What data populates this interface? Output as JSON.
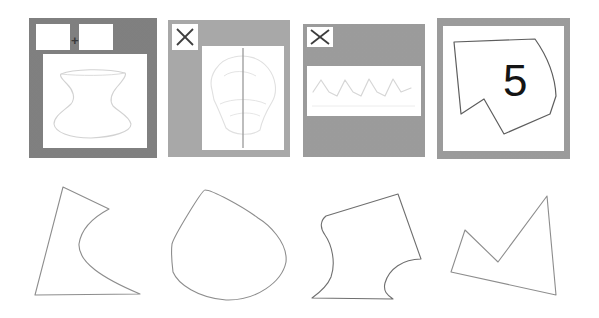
{
  "figure": {
    "background_color": "#ffffff",
    "width": 599,
    "height": 318
  },
  "palette": {
    "panel_border_dark": "#7e7e7e",
    "panel_border_mid": "#9b9b9b",
    "panel_border_light": "#a8a8a8",
    "canvas_white": "#ffffff",
    "ink_dark": "#2e2e2e",
    "ink_faint": "#cfcfcf",
    "ink_mid": "#8a8a8a",
    "numeral_color": "#141414"
  },
  "top_row": {
    "label": "Input sketch panels",
    "panels": [
      {
        "id": "panel-1",
        "name": "two-chip-plus-panel",
        "border_color": "#7e7e7e",
        "x": 29,
        "y": 18,
        "width": 128,
        "height": 140,
        "chips": [
          {
            "name": "chip-left",
            "x": 7,
            "y": 6,
            "width": 34,
            "height": 26
          },
          {
            "name": "chip-right",
            "x": 48,
            "y": 6,
            "width": 34,
            "height": 26
          }
        ],
        "plus": {
          "symbol": "+",
          "x": 41,
          "y": 15
        },
        "canvas": {
          "x": 14,
          "y": 36,
          "width": 104,
          "height": 94
        },
        "content_kind": "faint-hourglass-outline"
      },
      {
        "id": "panel-2",
        "name": "x-mark-symmetry-panel",
        "border_color": "#a8a8a8",
        "x": 168,
        "y": 20,
        "width": 122,
        "height": 137,
        "x_mark": {
          "symbol": "×",
          "box_x": 4,
          "box_y": 4,
          "box_w": 26,
          "box_h": 26
        },
        "canvas": {
          "x": 34,
          "y": 26,
          "width": 82,
          "height": 104
        },
        "content_kind": "faint-blob-with-vertical-axis",
        "axis_line": {
          "color": "#9a9a9a"
        }
      },
      {
        "id": "panel-3",
        "name": "x-mark-zigzag-panel",
        "border_color": "#9b9b9b",
        "x": 303,
        "y": 24,
        "width": 122,
        "height": 133,
        "x_mark": {
          "symbol": "×",
          "box_x": 4,
          "box_y": 3,
          "box_w": 26,
          "box_h": 20
        },
        "canvas": {
          "x": 4,
          "y": 42,
          "width": 114,
          "height": 50
        },
        "content_kind": "faint-zigzag-waveform"
      },
      {
        "id": "panel-4",
        "name": "numeral-polygon-panel",
        "border_color": "#9b9b9b",
        "x": 437,
        "y": 18,
        "width": 133,
        "height": 141,
        "canvas": {
          "x": 6,
          "y": 8,
          "width": 121,
          "height": 125
        },
        "numeral": {
          "text": "5",
          "x": 62,
          "y": 38,
          "font_size": 44
        },
        "content_kind": "dark-polygon-with-curved-right-edge"
      }
    ]
  },
  "bottom_row": {
    "label": "Extracted outline shapes",
    "shapes": [
      {
        "id": "shape-1",
        "name": "concave-arrow-shape",
        "x": 30,
        "y": 178,
        "width": 125,
        "height": 122,
        "stroke": "#8d8d8d",
        "description": "triangular outline with a deep concave notch curving in from the right"
      },
      {
        "id": "shape-2",
        "name": "rounded-teardrop-shape",
        "x": 160,
        "y": 178,
        "width": 132,
        "height": 126,
        "stroke": "#8d8d8d",
        "description": "rounded pentagon / teardrop blob tapering toward lower right"
      },
      {
        "id": "shape-3",
        "name": "s-curve-vase-shape",
        "x": 305,
        "y": 183,
        "width": 122,
        "height": 120,
        "stroke": "#6f6f6f",
        "description": "quadrilateral top with double S-curve sides forming a vase/hourglass base"
      },
      {
        "id": "shape-4",
        "name": "zigzag-notch-polygon",
        "x": 440,
        "y": 183,
        "width": 125,
        "height": 120,
        "stroke": "#8d8d8d",
        "description": "quadrilateral with a sharp V notch cut into the top edge"
      }
    ]
  }
}
